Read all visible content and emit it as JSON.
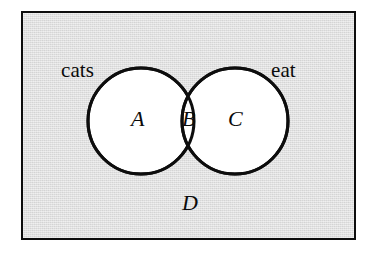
{
  "figure": {
    "type": "venn-diagram",
    "colors": {
      "page_background": "#ffffff",
      "universe_fill": "#e6e6e6",
      "universe_border": "#0d0d0d",
      "circle_fill": "#ffffff",
      "circle_stroke": "#0d0d0d",
      "text": "#0a0a0a"
    },
    "universe": {
      "label": "D",
      "shape": "rectangle"
    },
    "circles": [
      {
        "id": "left",
        "outside_label": "cats",
        "region_label": "A",
        "cx": 141,
        "cy": 121,
        "r": 53
      },
      {
        "id": "right",
        "outside_label": "eat",
        "region_label": "C",
        "cx": 235,
        "cy": 121,
        "r": 53
      }
    ],
    "intersection": {
      "label": "B"
    },
    "labels": {
      "cats": "cats",
      "eat": "eat",
      "region_a": "A",
      "region_b": "B",
      "region_c": "C",
      "region_d": "D"
    }
  }
}
